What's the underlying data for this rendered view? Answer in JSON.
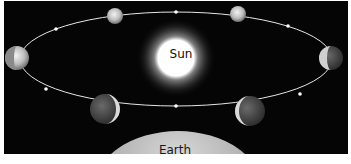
{
  "diagram": {
    "title": "",
    "sun": {
      "label": "Sun",
      "color": "#ffffff",
      "glow": "#8a8a8a"
    },
    "earth": {
      "label": "Earth",
      "color": "#bdbdbd"
    },
    "orbit": {
      "shape": "ellipse",
      "color": "#e6e6e6",
      "direction": "counterclockwise-arrows"
    },
    "planets": [
      {
        "id": "top-left",
        "phase": "gibbous"
      },
      {
        "id": "top-right",
        "phase": "gibbous"
      },
      {
        "id": "right",
        "phase": "half"
      },
      {
        "id": "bottom-right",
        "phase": "crescent"
      },
      {
        "id": "bottom-left",
        "phase": "crescent"
      },
      {
        "id": "left",
        "phase": "half"
      }
    ],
    "background": "#050505"
  }
}
